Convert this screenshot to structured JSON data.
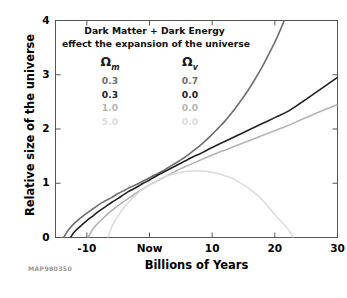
{
  "figure": {
    "credit": "MAP980350",
    "background": "#ffffff"
  },
  "annotation": {
    "line1": "Dark Matter + Dark Energy",
    "line2": "effect the expansion of the universe"
  },
  "legend": {
    "header_omega_m": "Ω",
    "header_omega_m_sub": "m",
    "header_omega_v": "Ω",
    "header_omega_v_sub": "v",
    "rows": [
      {
        "omega_m": "0.3",
        "omega_v": "0.7",
        "color": "#6e6e6e"
      },
      {
        "omega_m": "0.3",
        "omega_v": "0.0",
        "color": "#222222"
      },
      {
        "omega_m": "1.0",
        "omega_v": "0.0",
        "color": "#b4b4b4"
      },
      {
        "omega_m": "5.0",
        "omega_v": "0.0",
        "color": "#dcdcdc"
      }
    ]
  },
  "chart_data": {
    "type": "line",
    "title": "Dark Matter + Dark Energy effect the expansion of the universe",
    "xlabel": "Billions of Years",
    "ylabel": "Relative size of the universe",
    "xlim": [
      -15,
      30
    ],
    "ylim": [
      0,
      4
    ],
    "grid": false,
    "legend_position": "upper-left-inside",
    "xticks": [
      -10,
      0,
      10,
      20,
      30
    ],
    "xticklabels": [
      "-10",
      "Now",
      "10",
      "20",
      "30"
    ],
    "yticks": [
      0,
      1,
      2,
      3,
      4
    ],
    "yticklabels": [
      "0",
      "1",
      "2",
      "3",
      "4"
    ],
    "series": [
      {
        "name": "Om=0.3, Ov=0.7",
        "color": "#6e6e6e",
        "width": 1.6,
        "points": [
          [
            -13.7,
            0.0
          ],
          [
            -13.0,
            0.13
          ],
          [
            -12.0,
            0.26
          ],
          [
            -11.0,
            0.36
          ],
          [
            -10.0,
            0.45
          ],
          [
            -9.0,
            0.53
          ],
          [
            -8.0,
            0.61
          ],
          [
            -7.0,
            0.68
          ],
          [
            -6.0,
            0.74
          ],
          [
            -5.0,
            0.81
          ],
          [
            -4.0,
            0.87
          ],
          [
            -3.0,
            0.93
          ],
          [
            -2.0,
            0.98
          ],
          [
            -1.0,
            1.04
          ],
          [
            0.0,
            1.1
          ],
          [
            1.0,
            1.16
          ],
          [
            2.0,
            1.22
          ],
          [
            3.0,
            1.29
          ],
          [
            4.0,
            1.36
          ],
          [
            5.0,
            1.43
          ],
          [
            6.0,
            1.51
          ],
          [
            7.0,
            1.6
          ],
          [
            8.0,
            1.69
          ],
          [
            9.0,
            1.79
          ],
          [
            10.0,
            1.9
          ],
          [
            11.0,
            2.02
          ],
          [
            12.0,
            2.14
          ],
          [
            13.0,
            2.28
          ],
          [
            14.0,
            2.43
          ],
          [
            15.0,
            2.59
          ],
          [
            16.0,
            2.76
          ],
          [
            17.0,
            2.95
          ],
          [
            18.0,
            3.15
          ],
          [
            19.0,
            3.37
          ],
          [
            20.0,
            3.6
          ],
          [
            21.0,
            3.86
          ],
          [
            21.5,
            4.0
          ]
        ]
      },
      {
        "name": "Om=0.3, Ov=0.0",
        "color": "#222222",
        "width": 1.6,
        "points": [
          [
            -12.6,
            0.0
          ],
          [
            -12.0,
            0.1
          ],
          [
            -11.0,
            0.21
          ],
          [
            -10.0,
            0.31
          ],
          [
            -9.0,
            0.4
          ],
          [
            -8.0,
            0.49
          ],
          [
            -7.0,
            0.57
          ],
          [
            -6.0,
            0.65
          ],
          [
            -5.0,
            0.72
          ],
          [
            -4.0,
            0.8
          ],
          [
            -3.0,
            0.87
          ],
          [
            -2.0,
            0.93
          ],
          [
            -1.0,
            1.0
          ],
          [
            0.0,
            1.06
          ],
          [
            1.0,
            1.13
          ],
          [
            2.0,
            1.19
          ],
          [
            3.0,
            1.25
          ],
          [
            4.0,
            1.31
          ],
          [
            5.0,
            1.37
          ],
          [
            6.0,
            1.43
          ],
          [
            7.0,
            1.49
          ],
          [
            8.0,
            1.54
          ],
          [
            9.0,
            1.6
          ],
          [
            10.0,
            1.66
          ],
          [
            12.0,
            1.77
          ],
          [
            14.0,
            1.88
          ],
          [
            16.0,
            1.99
          ],
          [
            18.0,
            2.1
          ],
          [
            20.0,
            2.21
          ],
          [
            22.0,
            2.32
          ],
          [
            24.0,
            2.47
          ],
          [
            26.0,
            2.63
          ],
          [
            28.0,
            2.79
          ],
          [
            30.0,
            2.95
          ]
        ]
      },
      {
        "name": "Om=1.0, Ov=0.0",
        "color": "#b4b4b4",
        "width": 1.6,
        "points": [
          [
            -9.8,
            0.0
          ],
          [
            -9.0,
            0.16
          ],
          [
            -8.0,
            0.29
          ],
          [
            -7.0,
            0.4
          ],
          [
            -6.0,
            0.5
          ],
          [
            -5.0,
            0.59
          ],
          [
            -4.0,
            0.67
          ],
          [
            -3.0,
            0.75
          ],
          [
            -2.0,
            0.83
          ],
          [
            -1.0,
            0.9
          ],
          [
            0.0,
            0.97
          ],
          [
            1.0,
            1.03
          ],
          [
            2.0,
            1.09
          ],
          [
            3.0,
            1.15
          ],
          [
            4.0,
            1.21
          ],
          [
            5.0,
            1.27
          ],
          [
            6.0,
            1.32
          ],
          [
            8.0,
            1.42
          ],
          [
            10.0,
            1.52
          ],
          [
            12.0,
            1.61
          ],
          [
            14.0,
            1.7
          ],
          [
            16.0,
            1.79
          ],
          [
            18.0,
            1.88
          ],
          [
            20.0,
            1.97
          ],
          [
            22.0,
            2.06
          ],
          [
            24.0,
            2.16
          ],
          [
            26.0,
            2.26
          ],
          [
            28.0,
            2.36
          ],
          [
            30.0,
            2.45
          ]
        ]
      },
      {
        "name": "Om=5.0, Ov=0.0",
        "color": "#dcdcdc",
        "width": 1.6,
        "points": [
          [
            -6.6,
            0.0
          ],
          [
            -6.0,
            0.2
          ],
          [
            -5.0,
            0.4
          ],
          [
            -4.0,
            0.56
          ],
          [
            -3.0,
            0.69
          ],
          [
            -2.0,
            0.8
          ],
          [
            -1.0,
            0.89
          ],
          [
            0.0,
            0.97
          ],
          [
            1.0,
            1.04
          ],
          [
            2.0,
            1.1
          ],
          [
            3.0,
            1.14
          ],
          [
            4.0,
            1.18
          ],
          [
            5.0,
            1.2
          ],
          [
            6.0,
            1.22
          ],
          [
            7.0,
            1.225
          ],
          [
            8.0,
            1.225
          ],
          [
            9.0,
            1.22
          ],
          [
            10.0,
            1.2
          ],
          [
            11.0,
            1.18
          ],
          [
            12.0,
            1.14
          ],
          [
            13.0,
            1.1
          ],
          [
            14.0,
            1.04
          ],
          [
            15.0,
            0.97
          ],
          [
            16.0,
            0.89
          ],
          [
            17.0,
            0.8
          ],
          [
            18.0,
            0.69
          ],
          [
            19.0,
            0.56
          ],
          [
            20.0,
            0.42
          ],
          [
            21.0,
            0.3
          ],
          [
            22.0,
            0.17
          ],
          [
            22.9,
            0.0
          ]
        ]
      }
    ]
  }
}
